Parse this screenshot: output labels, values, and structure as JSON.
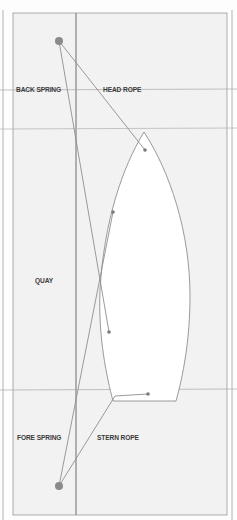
{
  "diagram": {
    "labels": {
      "back_spring": "BACK SPRING",
      "head_rope": "HEAD ROPE",
      "quay": "QUAY",
      "fore_spring": "FORE SPRING",
      "stern_rope": "STERN ROPE"
    },
    "colors": {
      "panel": "#f2f2f2",
      "line": "#8e8e8e",
      "bollard": "#8a8a8a",
      "boat": "#ffffff",
      "text": "#3a3a3a"
    }
  }
}
